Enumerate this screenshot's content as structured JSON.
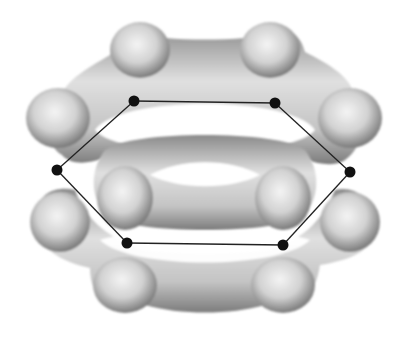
{
  "diagram": {
    "background": "#ffffff",
    "cloud_color": "#c8c8c8",
    "cloud_shadow": "#8c8c8c",
    "atom_color": "#111111",
    "bond_color": "#222222",
    "atoms": [
      {
        "id": "C1",
        "x": 134,
        "y": 101
      },
      {
        "id": "C2",
        "x": 275,
        "y": 103
      },
      {
        "id": "C3",
        "x": 350,
        "y": 172
      },
      {
        "id": "C4",
        "x": 283,
        "y": 245
      },
      {
        "id": "C5",
        "x": 127,
        "y": 243
      },
      {
        "id": "C6",
        "x": 57,
        "y": 170
      }
    ],
    "bonds": [
      [
        "C1",
        "C2"
      ],
      [
        "C2",
        "C3"
      ],
      [
        "C3",
        "C4"
      ],
      [
        "C4",
        "C5"
      ],
      [
        "C5",
        "C6"
      ],
      [
        "C6",
        "C1"
      ]
    ],
    "lobes": [
      {
        "name": "upper-pi-cloud",
        "cx": 203,
        "cy": 120,
        "rx": 172,
        "ry": 92
      },
      {
        "name": "lower-pi-cloud",
        "cx": 203,
        "cy": 222,
        "rx": 172,
        "ry": 92
      }
    ]
  }
}
